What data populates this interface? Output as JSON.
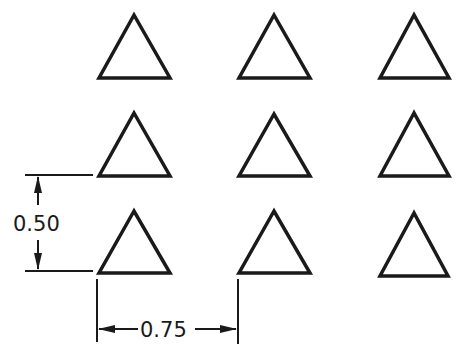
{
  "diagram": {
    "grid": {
      "rows": 3,
      "cols": 3
    },
    "triangles": [
      {
        "row": 0,
        "col": 0,
        "apex": [
          134,
          15
        ],
        "left": [
          99,
          78
        ],
        "right": [
          170,
          78
        ]
      },
      {
        "row": 0,
        "col": 1,
        "apex": [
          274,
          15
        ],
        "left": [
          239,
          78
        ],
        "right": [
          310,
          78
        ]
      },
      {
        "row": 0,
        "col": 2,
        "apex": [
          414,
          15
        ],
        "left": [
          380,
          78
        ],
        "right": [
          449,
          78
        ]
      },
      {
        "row": 1,
        "col": 0,
        "apex": [
          134,
          113
        ],
        "left": [
          99,
          176
        ],
        "right": [
          170,
          176
        ]
      },
      {
        "row": 1,
        "col": 1,
        "apex": [
          274,
          114
        ],
        "left": [
          239,
          176
        ],
        "right": [
          310,
          176
        ]
      },
      {
        "row": 1,
        "col": 2,
        "apex": [
          414,
          113
        ],
        "left": [
          380,
          176
        ],
        "right": [
          449,
          176
        ]
      },
      {
        "row": 2,
        "col": 0,
        "apex": [
          134,
          211
        ],
        "left": [
          99,
          273
        ],
        "right": [
          170,
          273
        ]
      },
      {
        "row": 2,
        "col": 1,
        "apex": [
          274,
          211
        ],
        "left": [
          239,
          273
        ],
        "right": [
          310,
          273
        ]
      },
      {
        "row": 2,
        "col": 2,
        "apex": [
          414,
          213
        ],
        "left": [
          380,
          276
        ],
        "right": [
          448,
          276
        ]
      }
    ],
    "dimensions": {
      "vertical": {
        "label": "0.50"
      },
      "horizontal": {
        "label": "0.75"
      }
    },
    "colors": {
      "stroke": "#1a1a1a",
      "background": "#ffffff"
    }
  }
}
